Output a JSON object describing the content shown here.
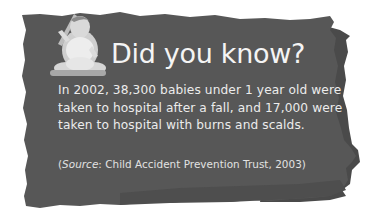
{
  "card": {
    "title": "Did you know?",
    "body": "In 2002, 38,300 babies under 1 year old were taken to hospital after a fall, and 17,000 were taken to hospital with burns and scalds.",
    "source": {
      "open_paren": "(",
      "label": "Source",
      "text": ": Child Accident Prevention Trust, 2003)"
    },
    "image": {
      "icon": "baby-photo",
      "alt": "Baby sitting holding a toy"
    }
  },
  "colors": {
    "paper": "#565656",
    "paper_shadow": "#464646",
    "text": "#ececec",
    "background": "#ffffff"
  }
}
